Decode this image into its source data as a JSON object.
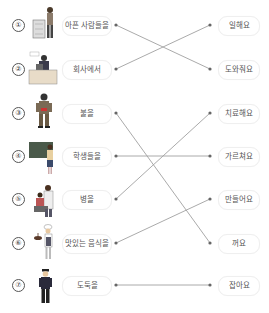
{
  "exercise": {
    "rows": [
      {
        "number": "①",
        "left": "아픈 사람들을",
        "right": "일해요"
      },
      {
        "number": "②",
        "left": "회사에서",
        "right": "도와줘요"
      },
      {
        "number": "③",
        "left": "불을",
        "right": "치료해요"
      },
      {
        "number": "④",
        "left": "학생들을",
        "right": "가르쳐요"
      },
      {
        "number": "⑤",
        "left": "병을",
        "right": "만들어요"
      },
      {
        "number": "⑥",
        "left": "맛있는 음식을",
        "right": "꺼요"
      },
      {
        "number": "⑦",
        "left": "도둑을",
        "right": "잡아요"
      }
    ],
    "illustrations": [
      "person-with-cart-icon",
      "office-worker-at-desk-icon",
      "firefighter-icon",
      "teacher-at-blackboard-icon",
      "doctor-with-patient-icon",
      "chef-icon",
      "police-officer-icon"
    ],
    "connections": [
      {
        "from": 1,
        "to": 2
      },
      {
        "from": 2,
        "to": 1
      },
      {
        "from": 3,
        "to": 6
      },
      {
        "from": 4,
        "to": 4
      },
      {
        "from": 5,
        "to": 3
      },
      {
        "from": 6,
        "to": 5
      },
      {
        "from": 7,
        "to": 7
      }
    ],
    "line_color": "#999999",
    "dot_color": "#666666"
  }
}
